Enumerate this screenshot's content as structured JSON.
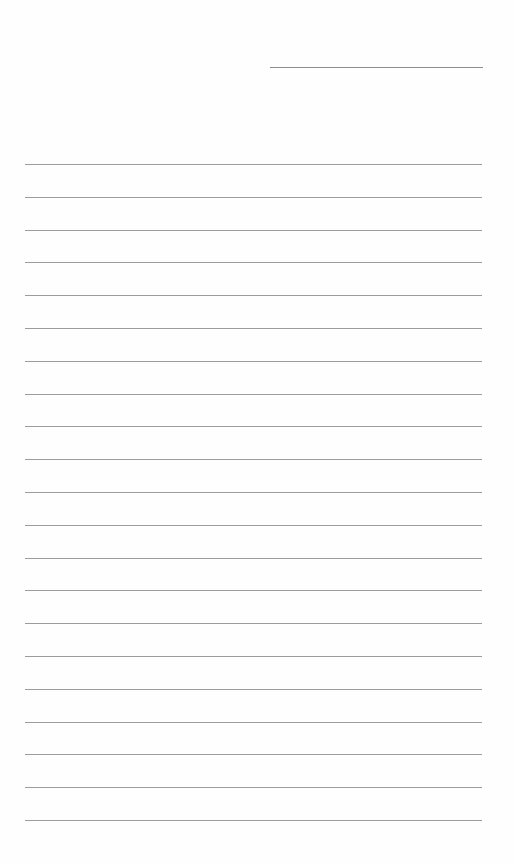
{
  "page": {
    "type": "lined-notepaper",
    "background_color": "#fefefe",
    "line_color": "#9c9c9c",
    "header_line": {
      "label": "date-line",
      "x": 270,
      "y": 67,
      "width": 213
    },
    "ruled_lines": {
      "count": 21,
      "x": 25,
      "width": 457,
      "first_y": 164,
      "spacing": 32.8
    },
    "text_content": []
  }
}
